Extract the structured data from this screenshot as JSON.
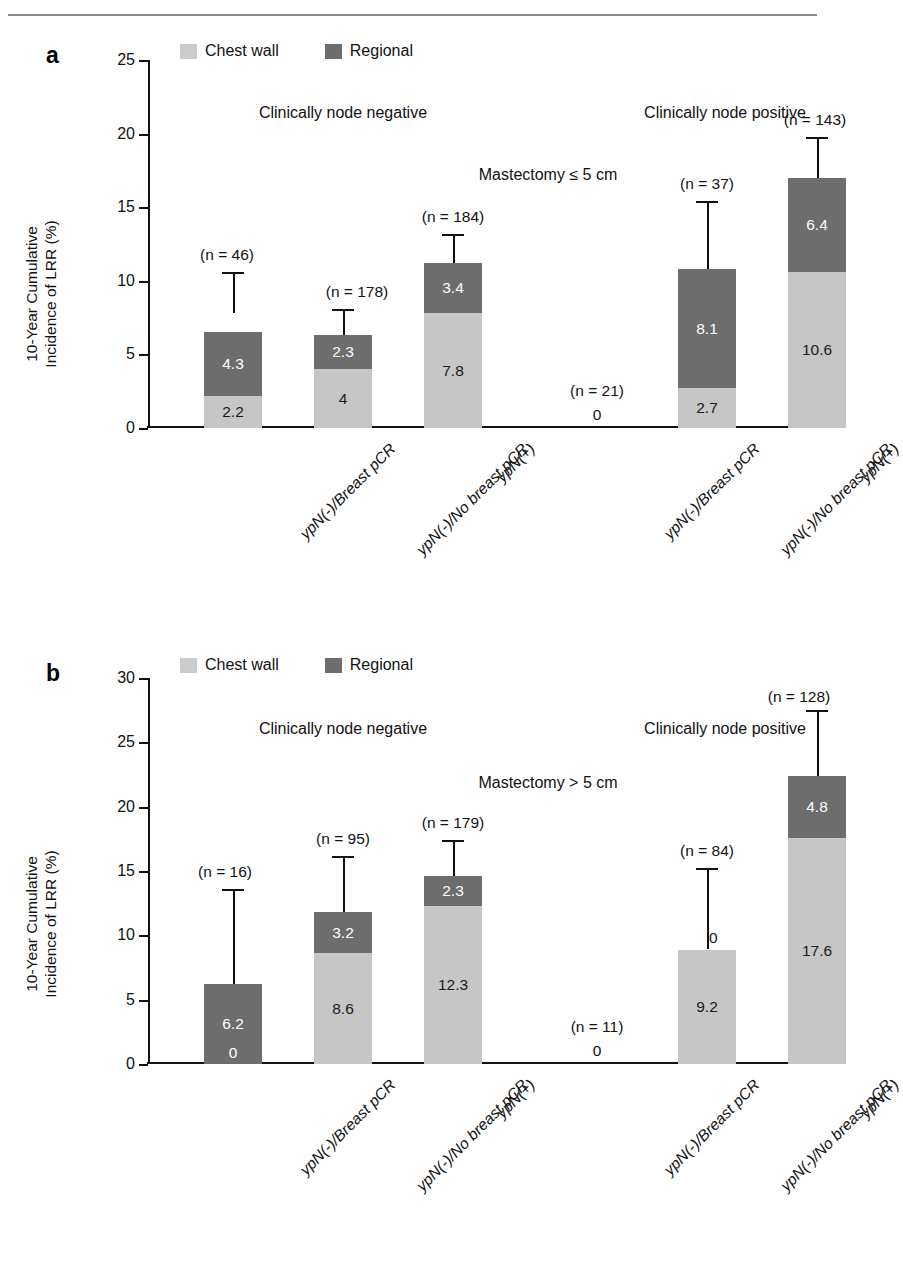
{
  "page": {
    "top_cut_text": "",
    "rule_color": "#8b8b8b"
  },
  "colors": {
    "chest_wall": "#c6c6c6",
    "regional": "#6d6d6d",
    "axis": "#111111",
    "text": "#1a1a1a"
  },
  "legend": {
    "chest_wall_label": "Chest wall",
    "regional_label": "Regional"
  },
  "axis": {
    "ylabel_line1": "10-Year Cumulative",
    "ylabel_line2": "Incidence of LRR (%)"
  },
  "panels": [
    {
      "letter": "a",
      "annotation": "Mastectomy ≤ 5 cm",
      "group_left": "Clinically node negative",
      "group_right": "Clinically node positive",
      "ymax": 25,
      "yticks": [
        "0",
        "5",
        "10",
        "15",
        "20",
        "25"
      ],
      "bars": [
        {
          "xlabel": "ypN(-)/Breast pCR",
          "n": "(n = 46)",
          "chest": 2.2,
          "regional": 4.3,
          "chest_text": "2.2",
          "regional_text": "4.3",
          "total": 7.8,
          "err_high": 10.6,
          "zero_text": ""
        },
        {
          "xlabel": "ypN(-)/No breast pCR",
          "n": "(n = 178)",
          "chest": 4.0,
          "regional": 2.3,
          "chest_text": "4",
          "regional_text": "2.3",
          "total": 6.3,
          "err_high": 8.1,
          "zero_text": ""
        },
        {
          "xlabel": "ypN(+)",
          "n": "(n = 184)",
          "chest": 7.8,
          "regional": 3.4,
          "chest_text": "7.8",
          "regional_text": "3.4",
          "total": 11.2,
          "err_high": 13.2,
          "zero_text": ""
        },
        {
          "xlabel": "ypN(-)/Breast pCR",
          "n": "(n = 21)",
          "chest": 0,
          "regional": 0,
          "chest_text": "",
          "regional_text": "",
          "total": 0,
          "err_high": 0,
          "zero_text": "0"
        },
        {
          "xlabel": "ypN(-)/No breast pCR",
          "n": "(n = 37)",
          "chest": 2.7,
          "regional": 8.1,
          "chest_text": "2.7",
          "regional_text": "8.1",
          "total": 10.8,
          "err_high": 15.4,
          "zero_text": ""
        },
        {
          "xlabel": "ypN(+)",
          "n": "(n = 143)",
          "chest": 10.6,
          "regional": 6.4,
          "chest_text": "10.6",
          "regional_text": "6.4",
          "total": 17.0,
          "err_high": 19.8,
          "zero_text": ""
        }
      ]
    },
    {
      "letter": "b",
      "annotation": "Mastectomy > 5 cm",
      "group_left": "Clinically node negative",
      "group_right": "Clinically node positive",
      "ymax": 30,
      "yticks": [
        "0",
        "5",
        "10",
        "15",
        "20",
        "25",
        "30"
      ],
      "bars": [
        {
          "xlabel": "ypN(-)/Breast pCR",
          "n": "(n = 16)",
          "chest": 0,
          "regional": 6.2,
          "chest_text": "0",
          "regional_text": "6.2",
          "total": 6.2,
          "err_high": 13.6,
          "zero_text": ""
        },
        {
          "xlabel": "ypN(-)/No breast pCR",
          "n": "(n = 95)",
          "chest": 8.6,
          "regional": 3.2,
          "chest_text": "8.6",
          "regional_text": "3.2",
          "total": 11.8,
          "err_high": 16.2,
          "zero_text": ""
        },
        {
          "xlabel": "ypN(+)",
          "n": "(n = 179)",
          "chest": 12.3,
          "regional": 2.3,
          "chest_text": "12.3",
          "regional_text": "2.3",
          "total": 14.6,
          "err_high": 17.4,
          "zero_text": ""
        },
        {
          "xlabel": "ypN(-)/Breast pCR",
          "n": "(n = 11)",
          "chest": 0,
          "regional": 0,
          "chest_text": "",
          "regional_text": "",
          "total": 0,
          "err_high": 0,
          "zero_text": "0"
        },
        {
          "xlabel": "ypN(-)/No breast pCR",
          "n": "(n = 84)",
          "chest": 8.9,
          "regional": 0,
          "chest_text": "9.2",
          "regional_text": "0",
          "total": 8.9,
          "err_high": 15.2,
          "zero_text": ""
        },
        {
          "xlabel": "ypN(+)",
          "n": "(n = 128)",
          "chest": 17.6,
          "regional": 4.8,
          "chest_text": "17.6",
          "regional_text": "4.8",
          "total": 22.4,
          "err_high": 27.5,
          "zero_text": ""
        }
      ]
    }
  ],
  "chart_data": {
    "type": "bar",
    "xlabel": "",
    "ylabel": "10-Year Cumulative Incidence of LRR (%)",
    "stacked": true,
    "grid": false,
    "legend_position": "top-left",
    "series_names": [
      "Chest wall",
      "Regional"
    ],
    "panels": [
      {
        "panel": "a",
        "subtitle": "Mastectomy ≤ 5 cm",
        "ylim": [
          0,
          25
        ],
        "yticks": [
          0,
          5,
          10,
          15,
          20,
          25
        ],
        "groups": [
          "Clinically node negative",
          "Clinically node positive"
        ],
        "categories": [
          "ypN(-)/Breast pCR",
          "ypN(-)/No breast pCR",
          "ypN(+)",
          "ypN(-)/Breast pCR",
          "ypN(-)/No breast pCR",
          "ypN(+)"
        ],
        "group_of_category": [
          "negative",
          "negative",
          "negative",
          "positive",
          "positive",
          "positive"
        ],
        "n": [
          46,
          178,
          184,
          21,
          37,
          143
        ],
        "series": [
          {
            "name": "Chest wall",
            "values": [
              2.2,
              4,
              7.8,
              0,
              2.7,
              10.6
            ]
          },
          {
            "name": "Regional",
            "values": [
              4.3,
              2.3,
              3.4,
              0,
              8.1,
              6.4
            ]
          }
        ],
        "totals": [
          7.8,
          6.3,
          11.2,
          0,
          10.8,
          17.0
        ],
        "error_upper": [
          10.6,
          8.1,
          13.2,
          0,
          15.4,
          19.8
        ]
      },
      {
        "panel": "b",
        "subtitle": "Mastectomy > 5 cm",
        "ylim": [
          0,
          30
        ],
        "yticks": [
          0,
          5,
          10,
          15,
          20,
          25,
          30
        ],
        "groups": [
          "Clinically node negative",
          "Clinically node positive"
        ],
        "categories": [
          "ypN(-)/Breast pCR",
          "ypN(-)/No breast pCR",
          "ypN(+)",
          "ypN(-)/Breast pCR",
          "ypN(-)/No breast pCR",
          "ypN(+)"
        ],
        "group_of_category": [
          "negative",
          "negative",
          "negative",
          "positive",
          "positive",
          "positive"
        ],
        "n": [
          16,
          95,
          179,
          11,
          84,
          128
        ],
        "series": [
          {
            "name": "Chest wall",
            "values": [
              0,
              8.6,
              12.3,
              0,
              9.2,
              17.6
            ]
          },
          {
            "name": "Regional",
            "values": [
              6.2,
              3.2,
              2.3,
              0,
              0,
              4.8
            ]
          }
        ],
        "totals": [
          6.2,
          11.8,
          14.6,
          0,
          8.9,
          22.4
        ],
        "error_upper": [
          13.6,
          16.2,
          17.4,
          0,
          15.2,
          27.5
        ]
      }
    ]
  }
}
